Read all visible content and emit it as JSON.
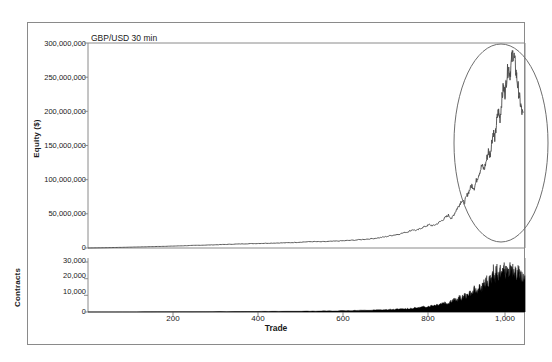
{
  "figure": {
    "title": "GBP/USD 30 min",
    "frame_color": "#8a8a8a",
    "line_color": "#4a4a4a",
    "fill_color": "#000000",
    "annotation_color": "#6e6e6e"
  },
  "axes": {
    "xlabel": "Trade",
    "equity_ylabel": "Equity ($)",
    "contracts_ylabel": "Contracts",
    "x_ticks": [
      "200",
      "400",
      "600",
      "800",
      "1,000"
    ],
    "equity_y_ticks": [
      "300,000,000",
      "250,000,000",
      "200,000,000",
      "150,000,000",
      "100,000,000",
      "50,000,000",
      "0"
    ],
    "contracts_y_ticks": [
      "30,000",
      "20,000",
      "10,000",
      "0"
    ]
  },
  "annotations": [
    {
      "name": "highlight-ellipse",
      "shape": "ellipse",
      "cx": 501,
      "cy": 143,
      "rx": 47,
      "ry": 99
    }
  ],
  "chart_data": {
    "type": "line",
    "title": "GBP/USD 30 min",
    "xlabel": "Trade",
    "ylabel": "Equity ($)",
    "xlim": [
      0,
      1050
    ],
    "grid": false,
    "legend": "none",
    "panels": [
      {
        "name": "equity-panel",
        "type": "line",
        "ylabel": "Equity ($)",
        "ylim": [
          0,
          300000000
        ],
        "yticks": [
          0,
          50000000,
          100000000,
          150000000,
          200000000,
          250000000,
          300000000
        ],
        "series": [
          {
            "name": "Equity",
            "x": [
              0,
              20,
              40,
              60,
              80,
              100,
              120,
              140,
              160,
              180,
              200,
              220,
              240,
              260,
              280,
              300,
              320,
              340,
              360,
              380,
              400,
              420,
              440,
              460,
              480,
              500,
              520,
              540,
              560,
              580,
              600,
              620,
              640,
              660,
              680,
              700,
              715,
              730,
              745,
              760,
              770,
              780,
              790,
              800,
              810,
              820,
              830,
              840,
              850,
              858,
              866,
              874,
              880,
              886,
              892,
              898,
              904,
              910,
              916,
              922,
              928,
              934,
              940,
              946,
              952,
              958,
              962,
              966,
              970,
              974,
              978,
              982,
              986,
              990,
              994,
              998,
              1002,
              1006,
              1010,
              1014,
              1018,
              1022,
              1026,
              1030,
              1034,
              1038,
              1042,
              1046,
              1050
            ],
            "y": [
              0,
              200000,
              400000,
              700000,
              900000,
              1200000,
              1500000,
              1800000,
              2100000,
              2400000,
              2700000,
              3100000,
              3500000,
              3900000,
              4200000,
              4600000,
              5000000,
              5400000,
              5800000,
              6200000,
              6500000,
              6800000,
              7100000,
              7400000,
              7700000,
              8200000,
              8900000,
              9400000,
              9100000,
              9600000,
              10200000,
              10800000,
              11500000,
              12500000,
              13500000,
              15000000,
              16500000,
              18500000,
              20000000,
              22500000,
              24000000,
              27000000,
              25500000,
              29000000,
              31500000,
              34000000,
              32500000,
              36000000,
              40000000,
              44000000,
              48000000,
              43000000,
              50000000,
              57000000,
              63000000,
              70000000,
              66000000,
              76000000,
              84000000,
              92000000,
              88000000,
              100000000,
              110000000,
              120000000,
              115000000,
              130000000,
              142000000,
              135000000,
              155000000,
              170000000,
              160000000,
              185000000,
              200000000,
              190000000,
              215000000,
              235000000,
              225000000,
              250000000,
              265000000,
              255000000,
              275000000,
              288000000,
              270000000,
              250000000,
              232000000,
              215000000,
              200000000,
              192000000
            ]
          }
        ]
      },
      {
        "name": "contracts-panel",
        "type": "area",
        "ylabel": "Contracts",
        "ylim": [
          0,
          30000
        ],
        "yticks": [
          0,
          10000,
          20000,
          30000
        ],
        "series": [
          {
            "name": "Contracts",
            "x": [
              0,
              100,
              200,
              300,
              400,
              450,
              500,
              540,
              580,
              620,
              650,
              680,
              700,
              720,
              740,
              760,
              775,
              790,
              800,
              812,
              824,
              836,
              846,
              856,
              864,
              872,
              880,
              886,
              892,
              898,
              904,
              910,
              916,
              922,
              928,
              934,
              940,
              946,
              950,
              954,
              958,
              962,
              966,
              970,
              974,
              978,
              982,
              986,
              990,
              994,
              998,
              1002,
              1006,
              1010,
              1014,
              1018,
              1022,
              1026,
              1030,
              1034,
              1038,
              1042,
              1046,
              1050
            ],
            "y": [
              20,
              60,
              120,
              200,
              280,
              340,
              420,
              500,
              620,
              760,
              880,
              1000,
              1150,
              1300,
              1500,
              1750,
              2000,
              2300,
              2600,
              3000,
              3500,
              4000,
              4600,
              5400,
              4800,
              6200,
              7000,
              6200,
              8200,
              7400,
              9500,
              8600,
              11000,
              9800,
              12500,
              11200,
              14000,
              12600,
              16500,
              14200,
              18500,
              15500,
              20500,
              17200,
              22500,
              18500,
              24500,
              19500,
              23000,
              20500,
              26000,
              21500,
              23500,
              20000,
              25500,
              21000,
              24000,
              22500,
              20500,
              23500,
              21000,
              19000,
              20000,
              18500
            ]
          }
        ]
      }
    ]
  }
}
